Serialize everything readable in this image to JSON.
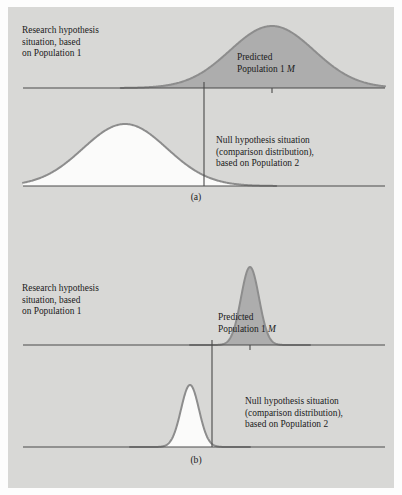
{
  "figure": {
    "background_color": "#d8d8d6",
    "page_color": "#fdfdfd",
    "curve_fill_color": "#adadad",
    "curve_outline_color": "#8d8d8d",
    "axis_color": "#4a4a4a",
    "text_color": "#1b1b1b"
  },
  "panel_a": {
    "letter": "(a)",
    "research_label": {
      "line1": "Research hypothesis",
      "line2": "situation, based",
      "line3": "on Population 1"
    },
    "predicted_label": {
      "line1": "Predicted",
      "line2_prefix": "Population 1 ",
      "line2_italic": "M"
    },
    "null_label": {
      "line1": "Null hypothesis situation",
      "line2": "(comparison distribution),",
      "line3": "based on Population 2"
    }
  },
  "panel_b": {
    "letter": "(b)",
    "research_label": {
      "line1": "Research hypothesis",
      "line2": "situation, based",
      "line3": "on Population 1"
    },
    "predicted_label": {
      "line1": "Predicted",
      "line2_prefix": "Population 1 ",
      "line2_italic": "M"
    },
    "null_label": {
      "line1": "Null hypothesis situation",
      "line2": "(comparison distribution),",
      "line3": "based on Population 2"
    }
  },
  "chart_data": {
    "type": "line",
    "title": "",
    "grid": false,
    "legend_position": "none",
    "panels": [
      {
        "letter": "(a)",
        "distributions": [
          {
            "name": "Predicted Population 1 M",
            "role": "research-hypothesis",
            "position": "upper",
            "mean_x": 272,
            "sd_x": 42,
            "peak_height": 62,
            "baseline_y": 88,
            "fill": "#adadad",
            "shape": "wide"
          },
          {
            "name": "Null hypothesis comparison distribution (Population 2)",
            "role": "null-hypothesis",
            "position": "lower",
            "mean_x": 125,
            "sd_x": 42,
            "peak_height": 62,
            "baseline_y": 186,
            "fill": "#fbfbfa",
            "shape": "wide"
          }
        ],
        "cutoff_x": 204,
        "axis_x_start": 23,
        "axis_x_end": 385
      },
      {
        "letter": "(b)",
        "distributions": [
          {
            "name": "Predicted Population 1 M",
            "role": "research-hypothesis",
            "position": "upper",
            "mean_x": 250,
            "sd_x": 9,
            "peak_height": 78,
            "baseline_y": 345,
            "fill": "#adadad",
            "shape": "narrow"
          },
          {
            "name": "Null hypothesis comparison distribution (Population 2)",
            "role": "null-hypothesis",
            "position": "lower",
            "mean_x": 190,
            "sd_x": 9,
            "peak_height": 62,
            "baseline_y": 447,
            "fill": "#fbfbfa",
            "shape": "narrow"
          }
        ],
        "cutoff_x": 212,
        "axis_x_start": 23,
        "axis_x_end": 385
      }
    ]
  }
}
